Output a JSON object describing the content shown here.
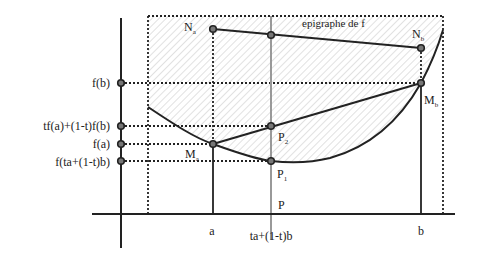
{
  "diagram": {
    "region_label": "epigraphe de f",
    "y_axis_labels": {
      "fb": "f(b)",
      "combo": "tf(a)+(1-t)f(b)",
      "fa": "f(a)",
      "f_comb": "f(ta+(1-t)b)"
    },
    "x_axis_labels": {
      "a": "a",
      "mid": "ta+(1-t)b",
      "b": "b"
    },
    "points": {
      "Na": {
        "name": "N",
        "sub": "a"
      },
      "Nb": {
        "name": "N",
        "sub": "b"
      },
      "Ma": {
        "name": "M",
        "sub": "a"
      },
      "Mb": {
        "name": "M",
        "sub": "b"
      },
      "P1": {
        "name": "P",
        "sub": "1"
      },
      "P2": {
        "name": "P",
        "sub": "2"
      },
      "P": {
        "name": "P",
        "sub": ""
      }
    },
    "colors": {
      "line": "#222222",
      "hatch": "#bbbbbb",
      "point_fill": "#777777",
      "vertical_gray": "#999999"
    }
  }
}
